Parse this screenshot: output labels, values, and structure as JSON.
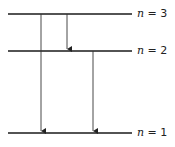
{
  "diagram": {
    "levels": [
      {
        "n": 3,
        "label_var": "n",
        "label_eq": " = 3",
        "y": 14
      },
      {
        "n": 2,
        "label_var": "n",
        "label_eq": " = 2",
        "y": 51
      },
      {
        "n": 1,
        "label_var": "n",
        "label_eq": " = 1",
        "y": 133
      }
    ],
    "transitions": [
      {
        "from": 3,
        "to": 1,
        "x": 41
      },
      {
        "from": 3,
        "to": 2,
        "x": 67
      },
      {
        "from": 2,
        "to": 1,
        "x": 93
      }
    ],
    "colors": {
      "line": "#1a1a1a",
      "arrow": "#333333"
    }
  }
}
